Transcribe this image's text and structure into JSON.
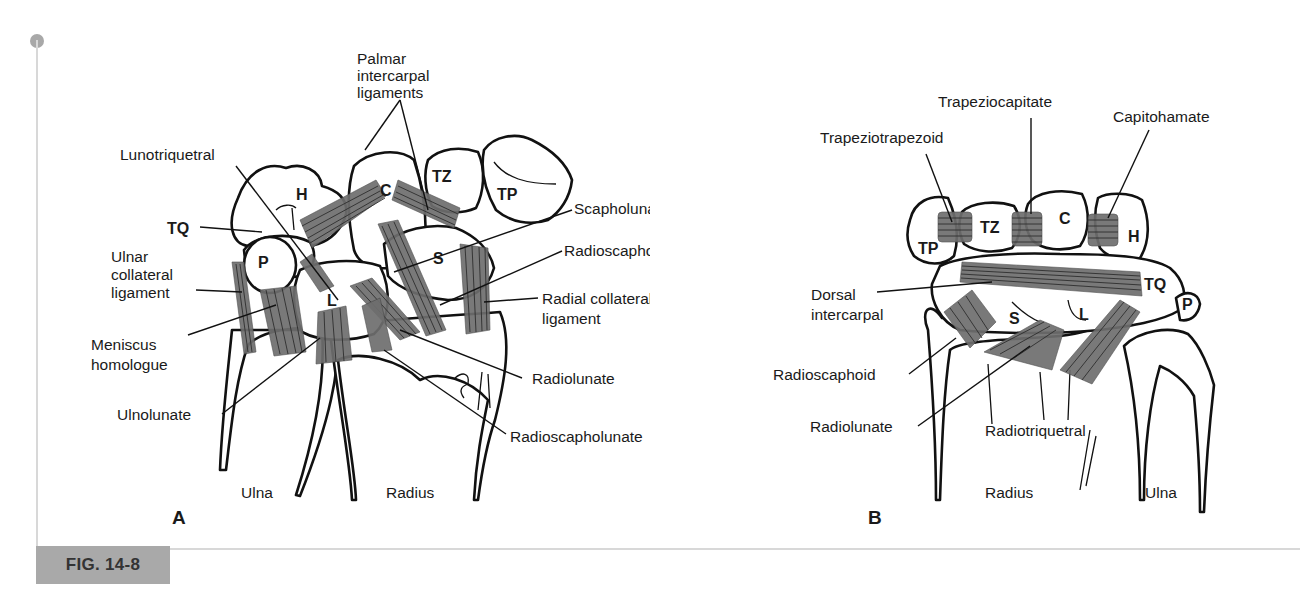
{
  "figure": {
    "label": "FIG. 14-8",
    "badge_color": "#a9a9a9"
  },
  "panel_a": {
    "letter": "A",
    "bones": {
      "hamate": "H",
      "capitate": "C",
      "trapezoid": "TZ",
      "trapezium": "TP",
      "triquetrum": "TQ",
      "pisiform": "P",
      "lunate": "L",
      "scaphoid": "S"
    },
    "labels": {
      "palmar_intercarpal_1": "Palmar",
      "palmar_intercarpal_2": "intercarpal",
      "palmar_intercarpal_3": "ligaments",
      "lunotriquetral": "Lunotriquetral",
      "tq": "TQ",
      "ulnar_collateral_1": "Ulnar",
      "ulnar_collateral_2": "collateral",
      "ulnar_collateral_3": "ligament",
      "meniscus_1": "Meniscus",
      "meniscus_2": "homologue",
      "ulnolunate": "Ulnolunate",
      "scapholunate": "Scapholunate",
      "radioscaphocapitate": "Radioscaphocapitate",
      "radial_collateral_1": "Radial collateral",
      "radial_collateral_2": "ligament",
      "radiolunate": "Radiolunate",
      "radioscapholunate": "Radioscapholunate",
      "ulna": "Ulna",
      "radius": "Radius"
    }
  },
  "panel_b": {
    "letter": "B",
    "bones": {
      "trapezium": "TP",
      "trapezoid": "TZ",
      "capitate": "C",
      "hamate": "H",
      "triquetrum": "TQ",
      "pisiform": "P",
      "scaphoid": "S",
      "lunate": "L"
    },
    "labels": {
      "trapeziotrapezoid": "Trapeziotrapezoid",
      "trapeziocapitate": "Trapeziocapitate",
      "capitohamate": "Capitohamate",
      "dorsal_intercarpal_1": "Dorsal",
      "dorsal_intercarpal_2": "intercarpal",
      "radioscaphoid": "Radioscaphoid",
      "radiolunate": "Radiolunate",
      "radiotriquetral": "Radiotriquetral",
      "radius": "Radius",
      "ulna": "Ulna"
    }
  }
}
